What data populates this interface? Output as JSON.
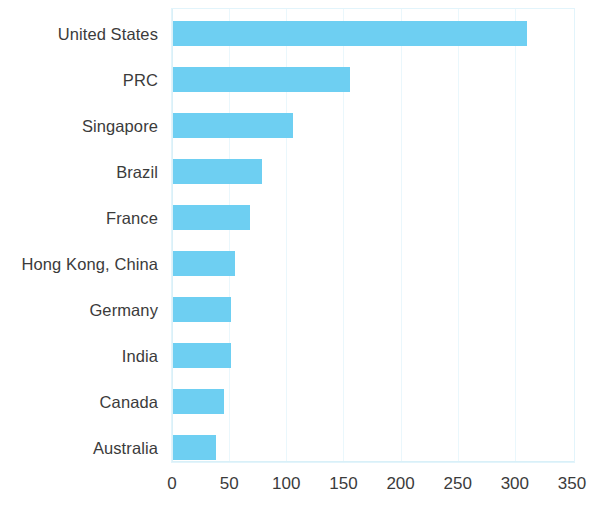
{
  "chart": {
    "type": "bar",
    "orientation": "horizontal",
    "bar_color": "#6ecff2",
    "gridline_color": "#eaf7fc",
    "axis_color": "#d9f0f8",
    "label_color": "#3b3b3b"
  },
  "chart_data": {
    "type": "bar",
    "title": "",
    "subtitle": "",
    "xlabel": "",
    "ylabel": "",
    "orientation": "horizontal",
    "categories": [
      "United States",
      "PRC",
      "Singapore",
      "Brazil",
      "France",
      "Hong Kong, China",
      "Germany",
      "India",
      "Canada",
      "Australia"
    ],
    "values": [
      310,
      155,
      105,
      78,
      67,
      54,
      51,
      51,
      45,
      38
    ],
    "series": [
      {
        "name": "Value",
        "values": [
          310,
          155,
          105,
          78,
          67,
          54,
          51,
          51,
          45,
          38
        ],
        "color": "#6ecff2"
      }
    ],
    "xlim": [
      0,
      350
    ],
    "xticks": [
      0,
      50,
      100,
      150,
      200,
      250,
      300,
      350
    ],
    "xtick_labels": [
      "0",
      "50",
      "100",
      "150",
      "200",
      "250",
      "300",
      "350"
    ],
    "grid": true,
    "grid_axis": "x",
    "legend": false,
    "legend_position": "none",
    "annotations": []
  }
}
